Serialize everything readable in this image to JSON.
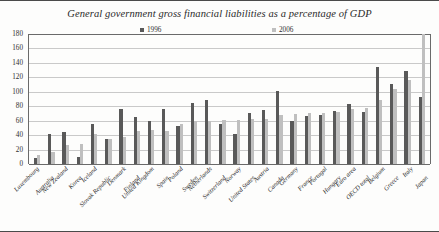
{
  "chart": {
    "title": "General government gross financial liabilities as a percentage of GDP",
    "legend": [
      {
        "label": "1996",
        "color": "#595959"
      },
      {
        "label": "2006",
        "color": "#bfbfbf"
      }
    ]
  },
  "chart_data": {
    "type": "bar",
    "title": "General government gross financial liabilities as a percentage of GDP",
    "xlabel": "",
    "ylabel": "",
    "ylim": [
      0,
      180
    ],
    "ytick_labels": [
      "0",
      "20",
      "40",
      "60",
      "80",
      "100",
      "120",
      "140",
      "160",
      "180"
    ],
    "ytick_values": [
      0,
      20,
      40,
      60,
      80,
      100,
      120,
      140,
      160,
      180
    ],
    "grid": true,
    "legend_position": "top",
    "categories": [
      "Luxembourg",
      "Australia",
      "New Zealand",
      "Korea",
      "Iceland",
      "Slovak Republic",
      "Denmark",
      "Finland",
      "United Kingdom",
      "Spain",
      "Poland",
      "Sweden",
      "Netherlands",
      "Switzerland",
      "Norway",
      "United States",
      "Austria",
      "Canada",
      "Germany",
      "France",
      "Portugal",
      "Hungary",
      "Euro area",
      "OECD total",
      "Belgium",
      "Greece",
      "Italy",
      "Japan"
    ],
    "series": [
      {
        "name": "1996",
        "color": "#595959",
        "values": [
          8,
          42,
          45,
          10,
          55,
          34,
          76,
          65,
          60,
          76,
          53,
          84,
          89,
          56,
          41,
          71,
          75,
          101,
          59,
          66,
          68,
          73,
          83,
          72,
          135,
          111,
          129,
          93
        ]
      },
      {
        "name": "2006",
        "color": "#bfbfbf",
        "values": [
          12,
          16,
          27,
          28,
          42,
          35,
          38,
          46,
          47,
          46,
          55,
          59,
          60,
          61,
          61,
          62,
          63,
          68,
          69,
          71,
          71,
          72,
          76,
          77,
          88,
          104,
          117,
          180
        ]
      }
    ]
  }
}
